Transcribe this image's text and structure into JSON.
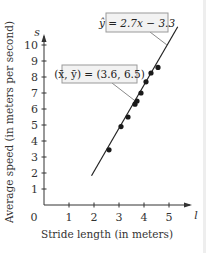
{
  "chart_data": {
    "type": "scatter",
    "title": "",
    "xlabel": "Stride length (in meters)",
    "ylabel": "Average speed (in meters per second)",
    "x_axis_symbol": "l",
    "y_axis_symbol": "s",
    "origin_label": "0",
    "xlim": [
      0,
      5.5
    ],
    "ylim": [
      0,
      10.5
    ],
    "x_ticks": [
      "1",
      "2",
      "3",
      "4",
      "5"
    ],
    "y_ticks": [
      "1",
      "2",
      "3",
      "4",
      "5",
      "6",
      "7",
      "8",
      "9",
      "10"
    ],
    "grid": false,
    "points": [
      {
        "x": 2.6,
        "y": 3.45
      },
      {
        "x": 3.08,
        "y": 4.9
      },
      {
        "x": 3.36,
        "y": 5.5
      },
      {
        "x": 3.64,
        "y": 6.3
      },
      {
        "x": 3.72,
        "y": 6.5
      },
      {
        "x": 3.88,
        "y": 7.0
      },
      {
        "x": 4.08,
        "y": 7.7
      },
      {
        "x": 4.28,
        "y": 8.25
      },
      {
        "x": 4.56,
        "y": 8.6
      }
    ],
    "regression_line": {
      "slope": 2.7,
      "intercept": -3.3,
      "x_start": 1.9,
      "x_end": 5.35
    },
    "annotations": [
      {
        "text": "ŷ = 2.7x − 3.3",
        "points_to": "regression-line"
      },
      {
        "text": "(x̄, ȳ) = (3.6, 6.5)",
        "points_to": "mean-point"
      }
    ]
  },
  "labels": {
    "regression": "ŷ = 2.7x − 3.3",
    "mean": "(x̄, ȳ) = (3.6, 6.5)",
    "xlabel": "Stride length (in meters)",
    "ylabel": "Average speed (in meters per second)",
    "x_symbol": "l",
    "y_symbol": "s",
    "origin": "0"
  },
  "colors": {
    "axis": "#333333",
    "point": "#1a1a1a",
    "box_fill": "#f2f2f2",
    "box_stroke": "#9a9a9a",
    "leader": "#8a8a8a"
  }
}
